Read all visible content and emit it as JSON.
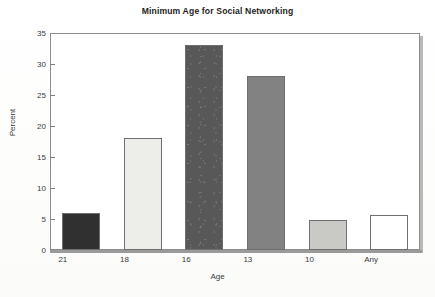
{
  "chart_data": {
    "type": "bar",
    "title": "Minimum Age for Social Networking",
    "xlabel": "Age",
    "ylabel": "Percent",
    "categories": [
      "21",
      "18",
      "16",
      "13",
      "10",
      "Any"
    ],
    "values": [
      6.0,
      18.0,
      33.0,
      28.0,
      4.8,
      5.6
    ],
    "ylim": [
      0,
      35
    ],
    "yticks": [
      0,
      5,
      10,
      15,
      20,
      25,
      30,
      35
    ],
    "ytick_labels": [
      "0",
      "5",
      "10",
      "15",
      "20",
      "25",
      "30",
      "35"
    ],
    "grid": false,
    "legend": "none",
    "bar_colors": [
      "#303030",
      "#ededea",
      "#585858",
      "#828282",
      "#c9c9c6",
      "#ffffff"
    ],
    "bar_border_color": "#6f6f6f",
    "frame_color": "#8d8d8d",
    "text_color": "#3a3a3a",
    "title_color": "#1d1d1d",
    "background": "#ffffff",
    "textured_bars": [
      2
    ]
  }
}
